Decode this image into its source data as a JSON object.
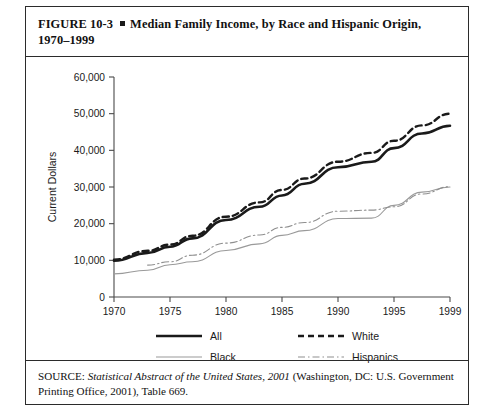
{
  "figure": {
    "number": "FIGURE  10-3",
    "bullet": "square-bullet",
    "title_line1": "Median Family Income, by Race and Hispanic Origin,",
    "title_line2": "1970–1999"
  },
  "source": {
    "label": "SOURCE:",
    "italic_part": "Statistical Abstract of the United States, 2001",
    "rest": " (Washington, DC: U.S. Government Printing Office, 2001), Table 669."
  },
  "legend": {
    "items": [
      {
        "label": "All",
        "style": "solid-thick",
        "color": "#1a1a1a"
      },
      {
        "label": "White",
        "style": "dashed",
        "color": "#1a1a1a"
      },
      {
        "label": "Black",
        "style": "solid-thin",
        "color": "#9a9a9a"
      },
      {
        "label": "Hispanics",
        "style": "dash-dot",
        "color": "#8f8f8f"
      }
    ]
  },
  "chart_data": {
    "type": "line",
    "title": "Median Family Income, by Race and Hispanic Origin, 1970–1999",
    "xlabel": "",
    "ylabel": "Current Dollars",
    "ylim": [
      0,
      60000
    ],
    "yticks": [
      0,
      10000,
      20000,
      30000,
      40000,
      50000,
      60000
    ],
    "ytick_labels": [
      "0",
      "10,000",
      "20,000",
      "30,000",
      "40,000",
      "50,000",
      "60,000"
    ],
    "xticks": [
      1970,
      1975,
      1980,
      1985,
      1990,
      1995,
      1999
    ],
    "xtick_labels": [
      "1970",
      "1975",
      "1980",
      "1985",
      "1990",
      "1995",
      "1999"
    ],
    "xlim": [
      1970,
      1999
    ],
    "grid": false,
    "legend_position": "below-axes",
    "x": [
      1970,
      1973,
      1975,
      1977,
      1980,
      1983,
      1985,
      1987,
      1990,
      1993,
      1995,
      1997,
      1999
    ],
    "series": [
      {
        "name": "All",
        "style": "solid-thick",
        "color": "#1a1a1a",
        "values": [
          9900,
          12000,
          13700,
          16000,
          21000,
          24600,
          27700,
          30900,
          35400,
          36900,
          40600,
          44600,
          46700
        ]
      },
      {
        "name": "White",
        "style": "dashed",
        "color": "#1a1a1a",
        "values": [
          10200,
          12600,
          14300,
          16700,
          21900,
          25800,
          29200,
          32300,
          36900,
          39300,
          42600,
          46800,
          50000
        ]
      },
      {
        "name": "Black",
        "style": "solid-thin",
        "color": "#9a9a9a",
        "values": [
          6300,
          7300,
          8800,
          9600,
          12700,
          14500,
          16800,
          18100,
          21400,
          21500,
          25000,
          28600,
          30000
        ]
      },
      {
        "name": "Hispanics",
        "style": "dash-dot",
        "color": "#8f8f8f",
        "values": [
          null,
          8700,
          9600,
          11400,
          14700,
          16900,
          19000,
          20300,
          23400,
          23700,
          24600,
          28100,
          30100
        ]
      }
    ]
  }
}
